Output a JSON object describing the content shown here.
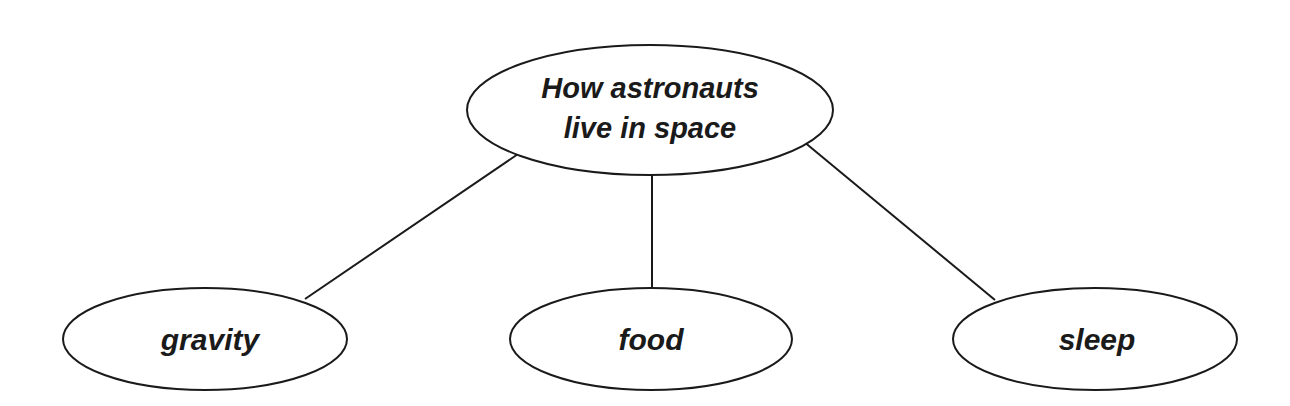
{
  "diagram": {
    "type": "concept-map",
    "root": {
      "label_lines": [
        "How astronauts",
        "live in space"
      ],
      "cx": 650,
      "cy": 110,
      "rx": 183,
      "ry": 65
    },
    "children": [
      {
        "label": "gravity",
        "cx": 205,
        "cy": 339,
        "rx": 142,
        "ry": 51
      },
      {
        "label": "food",
        "cx": 651,
        "cy": 339,
        "rx": 141,
        "ry": 51
      },
      {
        "label": "sleep",
        "cx": 1095,
        "cy": 339,
        "rx": 142,
        "ry": 51
      }
    ],
    "edges": [
      {
        "from": "root",
        "to": "gravity",
        "x1": 521,
        "y1": 152,
        "x2": 305,
        "y2": 299
      },
      {
        "from": "root",
        "to": "food",
        "x1": 652,
        "y1": 175,
        "x2": 652,
        "y2": 288
      },
      {
        "from": "root",
        "to": "sleep",
        "x1": 803,
        "y1": 141,
        "x2": 995,
        "y2": 300
      }
    ],
    "colors": {
      "stroke": "#1a1a1a",
      "fill": "#ffffff",
      "text": "#1a1a1a"
    }
  }
}
